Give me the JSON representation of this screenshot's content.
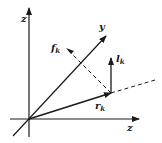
{
  "diagram": {
    "type": "vector-coordinate-diagram",
    "axes": [
      {
        "id": "vertical",
        "label": "z"
      },
      {
        "id": "oblique",
        "label": "y"
      },
      {
        "id": "horizontal",
        "label": "z"
      }
    ],
    "vectors": [
      {
        "id": "f",
        "label": "f",
        "subscript": "k",
        "style": "dashed-with-arrow"
      },
      {
        "id": "l",
        "label": "l",
        "subscript": "k",
        "style": "solid-arrow"
      },
      {
        "id": "r",
        "label": "r",
        "subscript": "k",
        "style": "solid-arrow"
      }
    ],
    "extension_line": {
      "style": "dashed",
      "description": "continuation of r_k direction"
    },
    "colors": {
      "ink": "#1a1a1a",
      "background": "#ffffff"
    }
  }
}
